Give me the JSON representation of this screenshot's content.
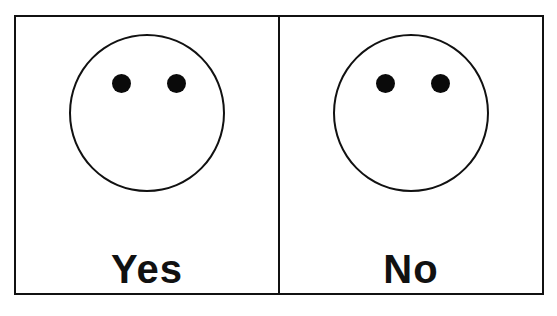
{
  "panels": [
    {
      "label": "Yes",
      "face": {
        "eyes": 2,
        "mouth": "none"
      }
    },
    {
      "label": "No",
      "face": {
        "eyes": 2,
        "mouth": "none"
      }
    }
  ],
  "colors": {
    "stroke": "#111111",
    "background": "#ffffff"
  }
}
